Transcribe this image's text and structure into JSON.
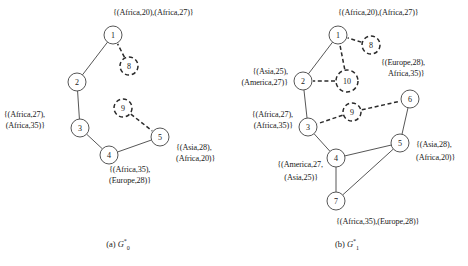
{
  "figure": {
    "panels": [
      {
        "id": "panel-a",
        "caption_prefix": "(a)",
        "caption_symbol": "G",
        "caption_sub": "0",
        "caption_sup": "*",
        "solid_nodes": [
          {
            "id": "1",
            "cx": 113,
            "cy": 35,
            "r": 9
          },
          {
            "id": "2",
            "cx": 77,
            "cy": 82,
            "r": 9
          },
          {
            "id": "3",
            "cx": 80,
            "cy": 128,
            "r": 9
          },
          {
            "id": "4",
            "cx": 109,
            "cy": 155,
            "r": 9
          },
          {
            "id": "5",
            "cx": 160,
            "cy": 137,
            "r": 9
          }
        ],
        "dashed_nodes": [
          {
            "id": "8",
            "cx": 129,
            "cy": 66,
            "r": 9
          },
          {
            "id": "9",
            "cx": 123,
            "cy": 108,
            "r": 9
          }
        ],
        "solid_edges": [
          {
            "from": "1",
            "to": "2"
          },
          {
            "from": "2",
            "to": "3"
          },
          {
            "from": "3",
            "to": "4"
          },
          {
            "from": "4",
            "to": "5"
          }
        ],
        "dashed_edges": [
          {
            "from": "8",
            "to": "1"
          },
          {
            "from": "9",
            "to": "5"
          }
        ],
        "labels": [
          {
            "text": "{(Africa,20),(Africa,27)}",
            "x": 113,
            "y": 13,
            "align": "center"
          },
          {
            "text": "{(Africa,27),",
            "x": 45,
            "y": 115,
            "align": "right"
          },
          {
            "text": "(Africa,35)}",
            "x": 45,
            "y": 126,
            "align": "right"
          },
          {
            "text": "{(Asia,28),",
            "x": 176,
            "y": 148,
            "align": "left"
          },
          {
            "text": "(Africa,20)}",
            "x": 176,
            "y": 159,
            "align": "left"
          },
          {
            "text": "{(Africa,35),",
            "x": 109,
            "y": 170,
            "align": "center"
          },
          {
            "text": "(Europe,28)}",
            "x": 109,
            "y": 181,
            "align": "center"
          }
        ]
      },
      {
        "id": "panel-b",
        "caption_prefix": "(b)",
        "caption_symbol": "G",
        "caption_sub": "1",
        "caption_sup": "*",
        "solid_nodes": [
          {
            "id": "1",
            "cx": 338,
            "cy": 35,
            "r": 9
          },
          {
            "id": "2",
            "cx": 303,
            "cy": 81,
            "r": 9
          },
          {
            "id": "3",
            "cx": 308,
            "cy": 127,
            "r": 9
          },
          {
            "id": "4",
            "cx": 336,
            "cy": 158,
            "r": 9
          },
          {
            "id": "5",
            "cx": 400,
            "cy": 143,
            "r": 9
          },
          {
            "id": "6",
            "cx": 410,
            "cy": 99,
            "r": 9
          },
          {
            "id": "7",
            "cx": 336,
            "cy": 201,
            "r": 9
          }
        ],
        "dashed_nodes": [
          {
            "id": "8",
            "cx": 371,
            "cy": 45,
            "r": 9
          },
          {
            "id": "9",
            "cx": 352,
            "cy": 112,
            "r": 9
          },
          {
            "id": "10",
            "cx": 347,
            "cy": 81,
            "r": 11
          }
        ],
        "solid_edges": [
          {
            "from": "1",
            "to": "2"
          },
          {
            "from": "2",
            "to": "3"
          },
          {
            "from": "3",
            "to": "4"
          },
          {
            "from": "4",
            "to": "5"
          },
          {
            "from": "4",
            "to": "7"
          },
          {
            "from": "7",
            "to": "5"
          },
          {
            "from": "5",
            "to": "6"
          }
        ],
        "dashed_edges": [
          {
            "from": "8",
            "to": "1"
          },
          {
            "from": "10",
            "to": "1"
          },
          {
            "from": "10",
            "to": "2"
          },
          {
            "from": "9",
            "to": "3"
          },
          {
            "from": "9",
            "to": "6"
          }
        ],
        "labels": [
          {
            "text": "{(Africa,20),(Africa,27)}",
            "x": 338,
            "y": 13,
            "align": "center"
          },
          {
            "text": "{(Asia,25),",
            "x": 288,
            "y": 72,
            "align": "right"
          },
          {
            "text": "(America,27)}",
            "x": 288,
            "y": 83,
            "align": "right"
          },
          {
            "text": "{(Europe,28),",
            "x": 381,
            "y": 63,
            "align": "left"
          },
          {
            "text": "Africa,35)}",
            "x": 388,
            "y": 74,
            "align": "left"
          },
          {
            "text": "{(Africa,27),",
            "x": 293,
            "y": 115,
            "align": "right"
          },
          {
            "text": "(Africa,35)}",
            "x": 293,
            "y": 126,
            "align": "right"
          },
          {
            "text": "{(Asia,28),",
            "x": 416,
            "y": 145,
            "align": "left"
          },
          {
            "text": "(Africa,20)}",
            "x": 416,
            "y": 158,
            "align": "left"
          },
          {
            "text": "{(America,27,",
            "x": 323,
            "y": 165,
            "align": "right"
          },
          {
            "text": "(Asia,25)}",
            "x": 318,
            "y": 178,
            "align": "right"
          },
          {
            "text": "{(Africa,35),(Europe,28)}",
            "x": 336,
            "y": 222,
            "align": "center"
          }
        ]
      }
    ],
    "captions": [
      {
        "x": 118,
        "y": 238
      },
      {
        "x": 347,
        "y": 238
      }
    ],
    "colors": {
      "stroke": "#2b2b2b",
      "text": "#1a1a1a",
      "background": "#ffffff"
    }
  }
}
